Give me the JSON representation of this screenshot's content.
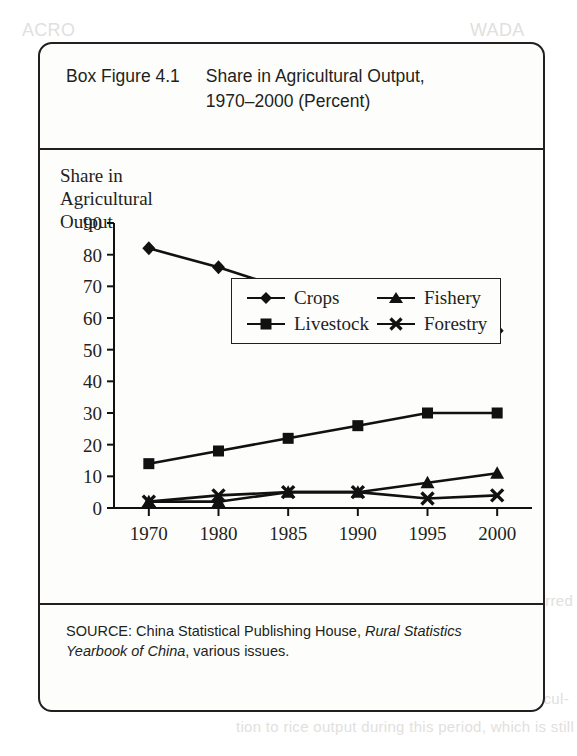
{
  "figure": {
    "number": "Box Figure 4.1",
    "title_line1": "Share in Agricultural Output,",
    "title_line2": "1970–2000 (Percent)"
  },
  "axis_title": {
    "line1": "Share in",
    "line2": "Agricultural",
    "line3": "Output"
  },
  "legend": {
    "items": [
      {
        "label": "Crops",
        "marker": "diamond-marker"
      },
      {
        "label": "Fishery",
        "marker": "triangle-marker"
      },
      {
        "label": "Livestock",
        "marker": "square-marker"
      },
      {
        "label": "Forestry",
        "marker": "x-marker"
      }
    ]
  },
  "source": {
    "prefix": "SOURCE: China Statistical Publishing House, ",
    "italic1": "Rural Statistics",
    "italic2": "Yearbook of China",
    "suffix": ", various issues."
  },
  "page_bleed": [
    {
      "text": "Employment",
      "x": 120,
      "y": 122,
      "size": 15
    },
    {
      "text": "SOURCE: Based on the Agriculture Development",
      "x": 236,
      "y": 232,
      "size": 10
    },
    {
      "text": "of Laos: Statistical Yearbook of China, various issues",
      "x": 236,
      "y": 246,
      "size": 10
    },
    {
      "text": "It is also interesting to note that agriculture’s",
      "x": 236,
      "y": 410,
      "size": 15
    },
    {
      "text": "structure of the region, such as Korea and",
      "x": 236,
      "y": 438,
      "size": 15
    },
    {
      "text": "have also been in Japan and continued to",
      "x": 236,
      "y": 466,
      "size": 15
    },
    {
      "text": "the early 1990s. Agricultural exports in",
      "x": 236,
      "y": 494,
      "size": 15
    },
    {
      "text": "this period were relatively as the",
      "x": 236,
      "y": 522,
      "size": 15
    },
    {
      "text": "be used to fund industrialization. It also occurred",
      "x": 236,
      "y": 592,
      "size": 15
    },
    {
      "text": "in other countries in the region.",
      "x": 236,
      "y": 620,
      "size": 15
    },
    {
      "text": "This experience in agriculture is explored in",
      "x": 236,
      "y": 662,
      "size": 15
    },
    {
      "text": "three decades, 1960 to the early 1970s. Agricul-",
      "x": 236,
      "y": 690,
      "size": 15
    },
    {
      "text": "tion to rice output during this period, which is still",
      "x": 236,
      "y": 718,
      "size": 15
    },
    {
      "text": "ACRO",
      "x": 22,
      "y": 20,
      "size": 18
    },
    {
      "text": "WADA",
      "x": 470,
      "y": 20,
      "size": 18
    }
  ],
  "chart_data": {
    "type": "line",
    "title": "Share in Agricultural Output, 1970–2000 (Percent)",
    "xlabel": "",
    "ylabel": "Share in Agricultural Output",
    "categories": [
      "1970",
      "1980",
      "1985",
      "1990",
      "1995",
      "2000"
    ],
    "ylim": [
      0,
      90
    ],
    "ytick_step": 10,
    "yticks": [
      0,
      10,
      20,
      30,
      40,
      50,
      60,
      70,
      80,
      90
    ],
    "grid": false,
    "legend_position": "top-center",
    "series": [
      {
        "name": "Crops",
        "marker": "diamond",
        "values": [
          82,
          76,
          69,
          65,
          58,
          56
        ]
      },
      {
        "name": "Livestock",
        "marker": "square",
        "values": [
          14,
          18,
          22,
          26,
          30,
          30
        ]
      },
      {
        "name": "Fishery",
        "marker": "triangle",
        "values": [
          2,
          2,
          5,
          5,
          8,
          11
        ]
      },
      {
        "name": "Forestry",
        "marker": "x",
        "values": [
          2,
          4,
          5,
          5,
          3,
          4
        ]
      }
    ]
  }
}
